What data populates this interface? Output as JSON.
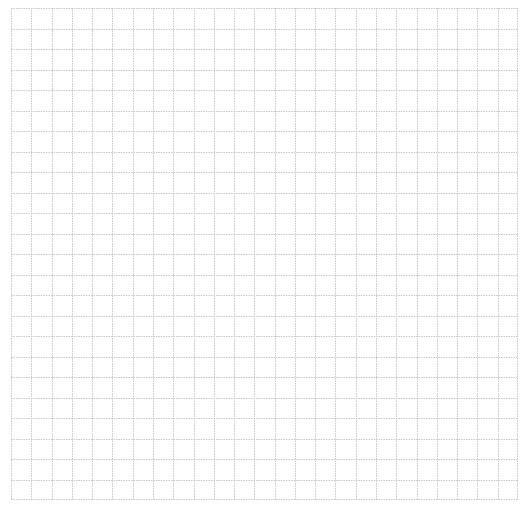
{
  "grid": {
    "columns": 25,
    "rows": 24,
    "cell_width": 20.28,
    "cell_height": 20.5,
    "line_color": "#c8c8c8",
    "background": "#ffffff",
    "line_style": "dotted"
  }
}
